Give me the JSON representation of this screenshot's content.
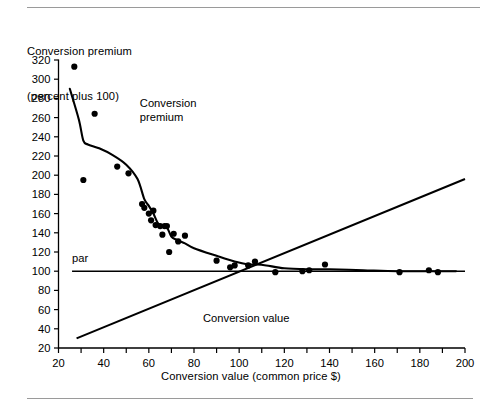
{
  "figure": {
    "rule_top_label": "top-divider-rule",
    "rule_bottom_label": "bottom-divider-rule"
  },
  "chart_data": {
    "type": "scatter",
    "title": "",
    "ylabel_line1": "Conversion premium",
    "ylabel_line2": "(percent plus 100)",
    "xlabel": "Conversion value (common price $)",
    "xlim": [
      20,
      200
    ],
    "ylim": [
      20,
      320
    ],
    "xticks": [
      20,
      30,
      40,
      50,
      60,
      70,
      80,
      90,
      100,
      110,
      120,
      130,
      140,
      150,
      160,
      170,
      180,
      190,
      200
    ],
    "xtick_labels": [
      "20",
      "",
      "40",
      "",
      "60",
      "",
      "80",
      "",
      "100",
      "",
      "120",
      "",
      "140",
      "",
      "160",
      "",
      "180",
      "",
      "200"
    ],
    "yticks": [
      20,
      40,
      60,
      80,
      100,
      120,
      140,
      160,
      180,
      200,
      220,
      240,
      260,
      280,
      300,
      320
    ],
    "ytick_labels": [
      "20",
      "40",
      "60",
      "80",
      "100",
      "120",
      "140",
      "160",
      "180",
      "200",
      "220",
      "240",
      "260",
      "280",
      "300",
      "320"
    ],
    "grid": false,
    "legend": "none",
    "annotations": [
      {
        "text": "Conversion",
        "x": 56,
        "y": 271,
        "name": "annotation-conversion-premium-line1"
      },
      {
        "text": "premium",
        "x": 56,
        "y": 256,
        "name": "annotation-conversion-premium-line2"
      },
      {
        "text": "par",
        "x": 26,
        "y": 110,
        "name": "annotation-par"
      },
      {
        "text": "Conversion value",
        "x": 84,
        "y": 47,
        "name": "annotation-conversion-value"
      }
    ],
    "series": [
      {
        "name": "Conversion premium (observations)",
        "type": "scatter",
        "marker": "filled-circle",
        "color": "#000000",
        "points": [
          [
            27,
            313
          ],
          [
            31,
            195
          ],
          [
            36,
            264
          ],
          [
            46,
            209
          ],
          [
            51,
            202
          ],
          [
            57,
            170
          ],
          [
            58,
            166
          ],
          [
            60,
            160
          ],
          [
            61,
            153
          ],
          [
            62,
            163
          ],
          [
            63,
            148
          ],
          [
            65,
            147
          ],
          [
            66,
            138
          ],
          [
            67,
            147
          ],
          [
            68,
            147
          ],
          [
            69,
            120
          ],
          [
            71,
            139
          ],
          [
            73,
            131
          ],
          [
            76,
            137
          ],
          [
            90,
            111
          ],
          [
            96,
            104
          ],
          [
            98,
            106
          ],
          [
            104,
            106
          ],
          [
            107,
            110
          ],
          [
            116,
            99
          ],
          [
            128,
            100
          ],
          [
            131,
            101
          ],
          [
            138,
            107
          ],
          [
            171,
            99
          ],
          [
            184,
            101
          ],
          [
            188,
            99
          ]
        ]
      },
      {
        "name": "Conversion premium (fitted curve)",
        "type": "line",
        "color": "#000000",
        "points": [
          [
            25,
            290
          ],
          [
            29,
            258
          ],
          [
            31,
            236
          ],
          [
            33,
            232
          ],
          [
            38,
            228
          ],
          [
            44,
            221
          ],
          [
            50,
            211
          ],
          [
            55,
            196
          ],
          [
            58,
            175
          ],
          [
            60,
            168
          ],
          [
            62,
            160
          ],
          [
            64,
            150
          ],
          [
            66,
            146
          ],
          [
            67,
            146
          ],
          [
            68,
            146
          ],
          [
            70,
            136
          ],
          [
            72,
            133
          ],
          [
            74,
            131
          ],
          [
            76,
            129
          ],
          [
            80,
            124
          ],
          [
            90,
            116
          ],
          [
            98,
            110
          ],
          [
            104,
            107
          ],
          [
            108,
            107
          ],
          [
            112,
            106
          ],
          [
            120,
            103
          ],
          [
            130,
            102
          ],
          [
            140,
            102
          ],
          [
            155,
            101
          ],
          [
            170,
            100
          ],
          [
            185,
            100
          ],
          [
            196,
            100
          ]
        ]
      },
      {
        "name": "Conversion value (45-degree parity line)",
        "type": "line",
        "color": "#000000",
        "points": [
          [
            28,
            30
          ],
          [
            200,
            196
          ]
        ]
      },
      {
        "name": "par",
        "type": "hline",
        "value": 100,
        "color": "#000000",
        "x_start": 26,
        "x_end": 200
      }
    ]
  }
}
